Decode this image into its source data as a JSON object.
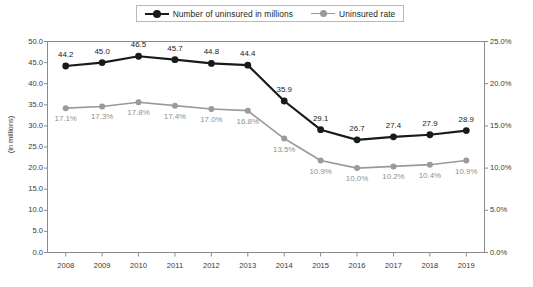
{
  "chart_data": {
    "type": "line",
    "title": "",
    "subtitle": "",
    "xlabel": "",
    "ylabel": "(in millions)",
    "ylabel_right": "",
    "categories": [
      "2008",
      "2009",
      "2010",
      "2011",
      "2012",
      "2013",
      "2014",
      "2015",
      "2016",
      "2017",
      "2018",
      "2019"
    ],
    "grid": false,
    "legend_position": "top-center",
    "ylim": [
      0.0,
      50.0
    ],
    "ylim_right": [
      0.0,
      25.0
    ],
    "yticks": [
      "0.0",
      "5.0",
      "10.0",
      "15.0",
      "20.0",
      "25.0",
      "30.0",
      "35.0",
      "40.0",
      "45.0",
      "50.0"
    ],
    "ytick_values": [
      0.0,
      5.0,
      10.0,
      15.0,
      20.0,
      25.0,
      30.0,
      35.0,
      40.0,
      45.0,
      50.0
    ],
    "yticks_right": [
      "0.0%",
      "5.0%",
      "10.0%",
      "15.0%",
      "20.0%",
      "25.0%"
    ],
    "ytick_values_right": [
      0.0,
      5.0,
      10.0,
      15.0,
      20.0,
      25.0
    ],
    "series": [
      {
        "name": "Number of uninsured in millions",
        "axis": "left",
        "color": "#1a1a1a",
        "values": [
          44.2,
          45.0,
          46.5,
          45.7,
          44.8,
          44.4,
          35.9,
          29.1,
          26.7,
          27.4,
          27.9,
          28.9
        ],
        "labels": [
          "44.2",
          "45.0",
          "46.5",
          "45.7",
          "44.8",
          "44.4",
          "35.9",
          "29.1",
          "26.7",
          "27.4",
          "27.9",
          "28.9"
        ]
      },
      {
        "name": "Uninsured rate",
        "axis": "right",
        "color": "#9a9a9a",
        "values": [
          17.1,
          17.3,
          17.8,
          17.4,
          17.0,
          16.8,
          13.5,
          10.9,
          10.0,
          10.2,
          10.4,
          10.9
        ],
        "labels": [
          "17.1%",
          "17.3%",
          "17.8%",
          "17.4%",
          "17.0%",
          "16.8%",
          "13.5%",
          "10.9%",
          "10.0%",
          "10.2%",
          "10.4%",
          "10.9%"
        ]
      }
    ]
  },
  "legend": {
    "items": [
      {
        "label": "Number of uninsured in millions",
        "color": "#1a1a1a"
      },
      {
        "label": "Uninsured rate",
        "color": "#9a9a9a"
      }
    ]
  }
}
